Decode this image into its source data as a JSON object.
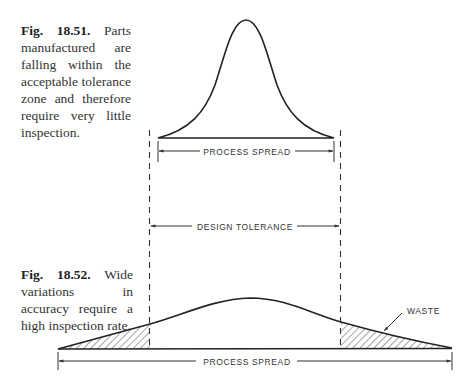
{
  "figures": [
    {
      "number": "Fig. 18.51.",
      "caption": "Parts manufactured are falling within the acceptable tolerance zone and therefore require very little inspection."
    },
    {
      "number": "Fig. 18.52.",
      "caption": "Wide variations in accuracy require a high inspection rate."
    }
  ],
  "labels": {
    "top_spread": "PROCESS SPREAD",
    "design_tolerance": "DESIGN TOLERANCE",
    "bottom_spread": "PROCESS SPREAD",
    "waste": "WASTE"
  },
  "colors": {
    "ink": "#2a2a2a",
    "background": "#ffffff"
  }
}
